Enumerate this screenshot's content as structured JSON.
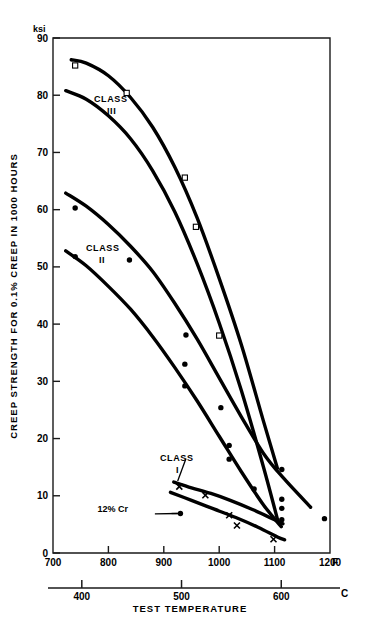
{
  "chart_data": {
    "type": "line",
    "title": "",
    "xlabel": "TEST TEMPERATURE",
    "ylabel": "CREEP STRENGTH FOR 0.1% CREEP IN 1000 HOURS",
    "y_unit": "ksi",
    "x_unit_primary": "F",
    "x_unit_secondary": "C",
    "xlim": [
      700,
      1200
    ],
    "ylim": [
      0,
      90
    ],
    "grid": false,
    "legend_position": "inline-annotations",
    "x_ticks": [
      700,
      800,
      900,
      1000,
      1100,
      1200
    ],
    "x_tick_labels": [
      "700",
      "800",
      "900",
      "1000",
      "1100",
      "1200"
    ],
    "x_ticks_secondary_c": [
      400,
      500,
      600
    ],
    "x_tick_labels_secondary": [
      "400",
      "500",
      "600"
    ],
    "y_ticks": [
      0,
      10,
      20,
      30,
      40,
      50,
      60,
      70,
      80,
      90
    ],
    "y_tick_labels": [
      "0",
      "10",
      "20",
      "30",
      "40",
      "50",
      "60",
      "70",
      "80",
      "90"
    ],
    "annotations": [
      {
        "text": "CLASS",
        "sub": "III",
        "x": 855,
        "y": 76.5
      },
      {
        "text": "CLASS",
        "sub": "II",
        "x": 835,
        "y": 51.5
      },
      {
        "text": "CLASS",
        "sub": "I",
        "x": 940,
        "y": 17.2
      },
      {
        "text": "12% Cr",
        "x": 868,
        "y": 6.8
      }
    ],
    "series": [
      {
        "name": "CLASS III upper",
        "marker": "open-square",
        "x": [
          733,
          760,
          800,
          840,
          880,
          920,
          960,
          1000,
          1040,
          1080,
          1105
        ],
        "y": [
          86.2,
          85.6,
          83.4,
          79.6,
          74.4,
          67.4,
          58.6,
          48.0,
          36.4,
          23.0,
          14.8
        ],
        "points_x": [
          740,
          833,
          1000
        ],
        "points_y": [
          85.2,
          80.4,
          38.0
        ]
      },
      {
        "name": "CLASS III lower",
        "marker": "open-square",
        "x": [
          723,
          760,
          800,
          840,
          880,
          920,
          960,
          1000,
          1040,
          1080,
          1106
        ],
        "y": [
          80.8,
          79.3,
          76.4,
          72.4,
          66.8,
          59.6,
          50.6,
          40.2,
          28.4,
          15.0,
          5.6
        ],
        "points_x": [
          938,
          958
        ],
        "points_y": [
          65.6,
          57.0
        ]
      },
      {
        "name": "CLASS II upper",
        "marker": "filled-circle",
        "x": [
          723,
          760,
          800,
          840,
          880,
          920,
          960,
          1000,
          1040,
          1080,
          1115,
          1165
        ],
        "y": [
          62.9,
          60.6,
          57.4,
          53.6,
          49.2,
          43.6,
          37.4,
          30.6,
          23.8,
          17.4,
          13.2,
          8.0
        ],
        "points_x": [
          740,
          838,
          940,
          1003,
          1113,
          1190
        ],
        "points_y": [
          60.3,
          51.2,
          38.1,
          25.4,
          14.6,
          6.0
        ]
      },
      {
        "name": "CLASS II lower",
        "marker": "filled-circle",
        "x": [
          723,
          760,
          800,
          840,
          880,
          920,
          960,
          1000,
          1040,
          1080,
          1112
        ],
        "y": [
          52.8,
          50.2,
          46.6,
          42.6,
          37.8,
          32.4,
          26.6,
          20.4,
          14.2,
          8.4,
          4.6
        ],
        "points_x": [
          740,
          938,
          938,
          1018,
          1018,
          1063,
          1113,
          1113,
          1113
        ],
        "points_y": [
          51.8,
          33.0,
          29.2,
          18.8,
          16.4,
          11.2,
          9.4,
          7.8,
          5.8
        ]
      },
      {
        "name": "CLASS I upper",
        "marker": "cross",
        "x": [
          918,
          950,
          985,
          1020,
          1060,
          1100,
          1115
        ],
        "y": [
          12.4,
          11.4,
          10.4,
          9.2,
          7.6,
          5.8,
          5.1
        ],
        "points_x": [
          928,
          975
        ],
        "points_y": [
          11.6,
          10.1
        ]
      },
      {
        "name": "CLASS I lower / 12% Cr",
        "marker": "cross",
        "x": [
          912,
          950,
          990,
          1030,
          1070,
          1105,
          1118
        ],
        "y": [
          10.6,
          9.2,
          7.7,
          6.2,
          4.5,
          2.8,
          2.3
        ],
        "points_x": [
          1018,
          1032,
          1098
        ],
        "points_y": [
          6.6,
          4.8,
          2.4
        ]
      },
      {
        "name": "12% Cr marker",
        "marker": "filled-circle",
        "points_x": [
          930
        ],
        "points_y": [
          6.9
        ]
      }
    ]
  },
  "axes": {
    "y_unit_label": "ksi",
    "y_title": "CREEP STRENGTH FOR 0.1% CREEP IN 1000 HOURS",
    "x_title": "TEST TEMPERATURE",
    "x_end_label_f": "F",
    "x_end_label_c": "C"
  },
  "labels": {
    "class3_line1": "CLASS",
    "class3_line2": "III",
    "class2_line1": "CLASS",
    "class2_line2": "II",
    "class1_line1": "CLASS",
    "class1_line2": "I",
    "cr_label": "12% Cr"
  },
  "colors": {
    "curve": "#000000",
    "axis": "#1a1a1a",
    "background": "#ffffff"
  }
}
